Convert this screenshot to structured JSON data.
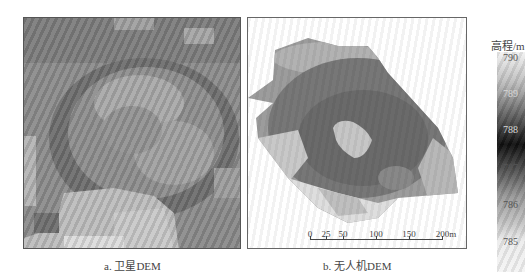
{
  "figure": {
    "panels": [
      {
        "id": "a",
        "caption": "a. 卫星DEM",
        "content": "satellite DEM grayscale raster, coarse pixel blocks, bowl-shaped terrain with darker ring and lighter areas bottom"
      },
      {
        "id": "b",
        "caption": "b. 无人机DEM",
        "content": "UAV DEM grayscale raster, rotated irregular footprint, dark central ring with light patches, light bottom area"
      }
    ],
    "legend": {
      "title": "高程/m",
      "ticks": [
        "790",
        "789",
        "788",
        "787",
        "786",
        "785"
      ],
      "colors": {
        "790": "#f2f2f2",
        "789": "#8a8a8a",
        "788": "#0e0e0e",
        "787": "#707070",
        "786": "#b8b8b8",
        "785": "#f4f4f4"
      }
    },
    "scale_bar": {
      "labels": [
        "0",
        "25",
        "50",
        "100",
        "150",
        "200m"
      ],
      "positions": [
        0,
        25,
        50,
        100,
        150,
        200
      ]
    }
  }
}
